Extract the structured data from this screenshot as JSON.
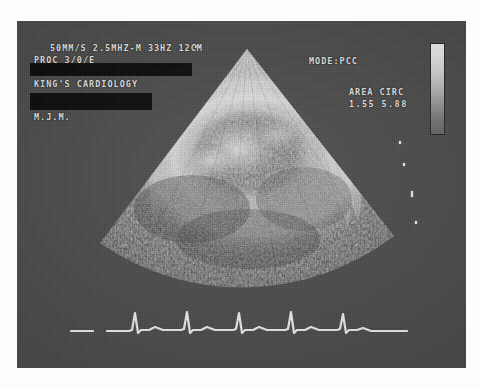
{
  "device": {
    "screen_background": "#4a4a4a",
    "text_color": "#e8e8e8"
  },
  "osd": {
    "settings_line": "50MM/S 2.5MHZ-M 33HZ 12CM",
    "proc_line": "PROC  3/0/E",
    "clinic_name": "KING'S CARDIOLOGY",
    "operator_initials": "M.J.M.",
    "mode_label": "MODE:PCC",
    "measurement_label": "AREA CIRC",
    "measurement_values": "1.55 5.88"
  },
  "redaction": {
    "top_bar_label": "patient-name-redacted",
    "bottom_bar_label": "patient-id-redacted"
  },
  "grayscale": {
    "label": "grayscale-calibration-wedge",
    "top_color": "#f2f2f2",
    "bottom_color": "#656565"
  },
  "image": {
    "modality": "echocardiogram",
    "view": "parasternal-short-axis",
    "sector_apex_x": 230,
    "sector_apex_y": 25,
    "sector_depth_cm": 12
  },
  "ecg": {
    "label": "ecg-trace",
    "beat_count": 5,
    "sweep_speed": "50MM/S",
    "trace_color": "#f0f0f0"
  }
}
